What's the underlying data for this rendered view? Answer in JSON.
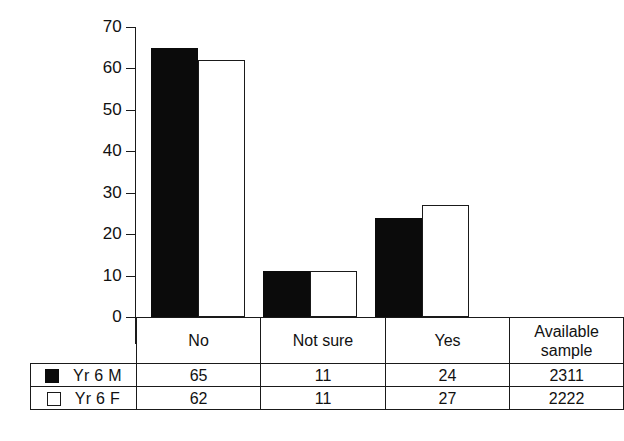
{
  "chart_data": {
    "type": "bar",
    "title": "",
    "xlabel": "",
    "ylabel": "",
    "categories": [
      "No",
      "Not sure",
      "Yes"
    ],
    "ylim": [
      0,
      70
    ],
    "yticks": [
      0,
      10,
      20,
      30,
      40,
      50,
      60,
      70
    ],
    "grid": false,
    "legend_position": "table-left",
    "series": [
      {
        "name": "Yr 6 M",
        "marker": "filled-square",
        "color": "#0b0b0b",
        "values": [
          65,
          11,
          24
        ]
      },
      {
        "name": "Yr 6 F",
        "marker": "hollow-square",
        "color": "#ffffff",
        "values": [
          62,
          11,
          27
        ]
      }
    ],
    "available_sample": {
      "label_line1": "Available",
      "label_line2": "sample",
      "values": [
        "2311",
        "2222"
      ]
    }
  },
  "axis": {
    "tick_labels": [
      "70",
      "60",
      "50",
      "40",
      "30",
      "20",
      "10",
      "0"
    ]
  },
  "table": {
    "header": {
      "category_1": "No",
      "category_2": "Not sure",
      "category_3": "Yes",
      "sample_line1": "Available",
      "sample_line2": "sample"
    },
    "rows": [
      {
        "legend": "Yr 6 M",
        "no": "65",
        "not_sure": "11",
        "yes": "24",
        "sample": "2311"
      },
      {
        "legend": "Yr 6 F",
        "no": "62",
        "not_sure": "11",
        "yes": "27",
        "sample": "2222"
      }
    ]
  }
}
